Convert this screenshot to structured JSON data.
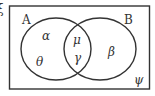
{
  "diagram": {
    "type": "venn",
    "universal_symbol": "ξ",
    "sets": [
      {
        "name": "A"
      },
      {
        "name": "B"
      }
    ],
    "regions": {
      "a_only_top": "α",
      "a_only_bottom": "θ",
      "intersection_top": "μ",
      "intersection_bottom": "γ",
      "b_only": "β",
      "outside": "ψ"
    },
    "colors": {
      "stroke": "#333333",
      "background": "#ffffff"
    }
  }
}
